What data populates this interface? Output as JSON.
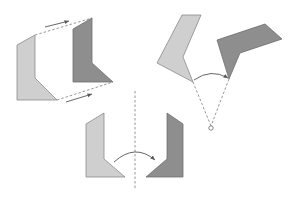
{
  "diagram": {
    "colors": {
      "original": "#cfcfcf",
      "image": "#8e8e8e",
      "guide": "#8a8a8a",
      "arrow": "#555555"
    },
    "panels": [
      {
        "id": "translation",
        "label": ""
      },
      {
        "id": "rotation",
        "label": ""
      },
      {
        "id": "reflection",
        "label": ""
      }
    ]
  }
}
